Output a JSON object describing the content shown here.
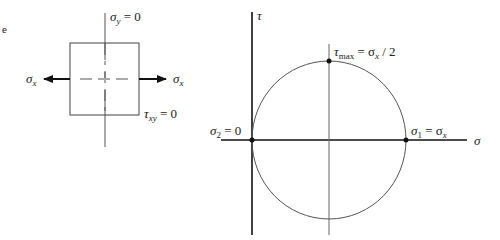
{
  "element": {
    "title": "Uniaxial stress element",
    "sigma_y_label": {
      "sym": "σ",
      "sub": "y",
      "rest": " = 0"
    },
    "sigma_x_left": {
      "sym": "σ",
      "sub": "x"
    },
    "sigma_x_right": {
      "sym": "σ",
      "sub": "x"
    },
    "tau_xy_label": {
      "sym": "τ",
      "sub": "xy",
      "rest": " = 0"
    }
  },
  "mohr": {
    "title": "Mohr's circle for uniaxial tension",
    "tau_axis_label": "τ",
    "sigma_axis_label": "σ",
    "top_point_label": {
      "sym": "τ",
      "sub": "max",
      "rest": " = σ",
      "sub2": "x",
      "rest2": " / 2"
    },
    "left_point_label": {
      "sym": "σ",
      "sub": "2",
      "rest": " = 0"
    },
    "right_point_label": {
      "sym": "σ",
      "sub": "1",
      "rest": " = σ",
      "sub2": "x"
    }
  },
  "colors": {
    "line": "#222222",
    "thin": "#555555"
  }
}
